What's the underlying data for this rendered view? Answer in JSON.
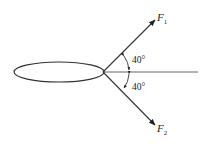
{
  "diagram": {
    "title": "",
    "forces": [
      {
        "name": "F",
        "subscript": "1",
        "angle_deg": 40,
        "direction": "above horizontal"
      },
      {
        "name": "F",
        "subscript": "2",
        "angle_deg": 40,
        "direction": "below horizontal"
      }
    ],
    "angle_labels": [
      "40°",
      "40°"
    ],
    "colors": {
      "line": "#333333",
      "background": "#ffffff"
    }
  }
}
